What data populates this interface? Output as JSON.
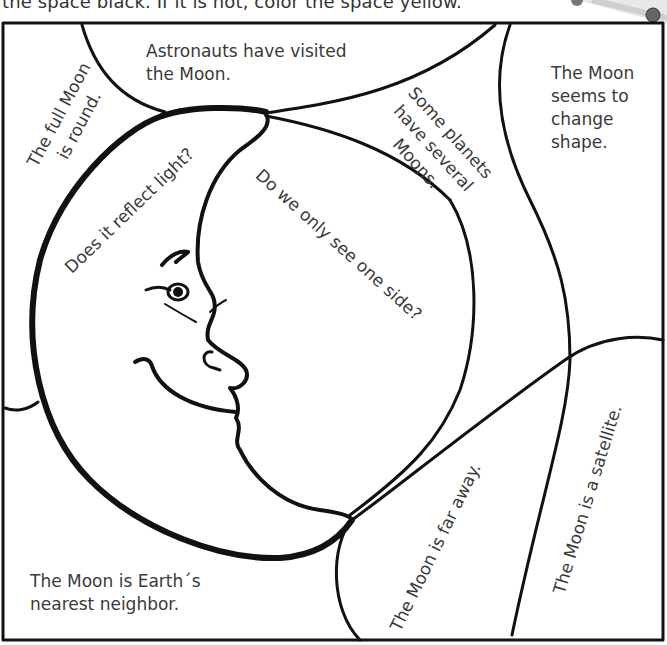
{
  "instructions": {
    "text": "the space black. If it is not, color the space yellow."
  },
  "puzzle": {
    "spaces": [
      {
        "id": "astronauts",
        "lines": [
          "Astronauts have visited",
          "the Moon."
        ]
      },
      {
        "id": "full-moon",
        "lines": [
          "The full Moon",
          "is round."
        ]
      },
      {
        "id": "some-planets",
        "lines": [
          "Some planets",
          "have several",
          "Moons."
        ]
      },
      {
        "id": "seems-to-change",
        "lines": [
          "The Moon",
          "seems to",
          "change",
          "shape."
        ]
      },
      {
        "id": "reflect-light",
        "lines": [
          "Does it reflect light?"
        ]
      },
      {
        "id": "one-side",
        "lines": [
          "Do we only see one side?"
        ]
      },
      {
        "id": "far-away",
        "lines": [
          "The Moon is far away."
        ]
      },
      {
        "id": "satellite",
        "lines": [
          "The Moon is a satellite."
        ]
      },
      {
        "id": "nearest-neighbor",
        "lines": [
          "The Moon is Earth´s",
          "nearest neighbor."
        ]
      }
    ]
  },
  "colors": {
    "line": "#111111",
    "text": "#3a3a3a",
    "background": "#ffffff"
  }
}
